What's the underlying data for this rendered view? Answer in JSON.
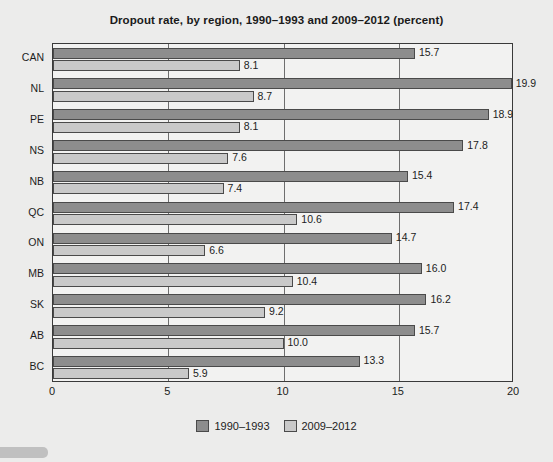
{
  "chart_data": {
    "type": "bar",
    "orientation": "horizontal",
    "title": "Dropout rate, by region, 1990–1993 and 2009–2012 (percent)",
    "xlabel": "",
    "ylabel": "",
    "xlim": [
      0,
      20
    ],
    "xticks": [
      "0",
      "5",
      "10",
      "15",
      "20"
    ],
    "grid": true,
    "grid_axis": "x",
    "legend_position": "bottom-center",
    "categories": [
      "CAN",
      "NL",
      "PE",
      "NS",
      "NB",
      "QC",
      "ON",
      "MB",
      "SK",
      "AB",
      "BC"
    ],
    "series": [
      {
        "name": "1990–1993",
        "color": "#8d8d8d",
        "values": [
          15.7,
          19.9,
          18.9,
          17.8,
          15.4,
          17.4,
          14.7,
          16.0,
          16.2,
          15.7,
          13.3
        ],
        "labels": [
          "15.7",
          "19.9",
          "18.9",
          "17.8",
          "15.4",
          "17.4",
          "14.7",
          "16.0",
          "16.2",
          "15.7",
          "13.3"
        ]
      },
      {
        "name": "2009–2012",
        "color": "#c9c9c9",
        "values": [
          8.1,
          8.7,
          8.1,
          7.6,
          7.4,
          10.6,
          6.6,
          10.4,
          9.2,
          10.0,
          5.9
        ],
        "labels": [
          "8.1",
          "8.7",
          "8.1",
          "7.6",
          "7.4",
          "10.6",
          "6.6",
          "10.4",
          "9.2",
          "10.0",
          "5.9"
        ]
      }
    ]
  },
  "legend": {
    "items": [
      {
        "label": "1990–1993",
        "color": "#8d8d8d"
      },
      {
        "label": "2009–2012",
        "color": "#c9c9c9"
      }
    ]
  },
  "colors": {
    "page_background": "#ececeb",
    "plot_background": "#f2f2f1",
    "axis": "#3a3a3a",
    "gridline": "#6e6e6e",
    "text": "#1c1c1c",
    "series_old": "#8d8d8d",
    "series_new": "#c9c9c9"
  }
}
